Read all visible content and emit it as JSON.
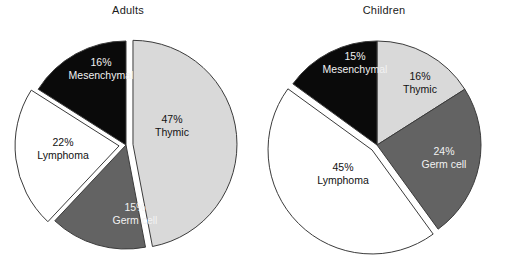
{
  "figure": {
    "background_color": "#ffffff",
    "outline_color": "#3b3b3b",
    "width": 513,
    "height": 271
  },
  "palette": {
    "thymic": "#d9d9d9",
    "germ_cell": "#636363",
    "lymphoma": "#ffffff",
    "mesenchymal": "#0a0a0a",
    "label_dark": "#111111",
    "label_light": "#f2f2f2"
  },
  "panels": {
    "adults": {
      "title": "Adults",
      "labels": {
        "thymic": {
          "pct": "47%",
          "name": "Thymic"
        },
        "germ_cell": {
          "pct": "15%",
          "name": "Germ cell"
        },
        "lymphoma": {
          "pct": "22%",
          "name": "Lymphoma"
        },
        "mesenchymal": {
          "pct": "16%",
          "name": "Mesenchymal"
        }
      }
    },
    "children": {
      "title": "Children",
      "labels": {
        "thymic": {
          "pct": "16%",
          "name": "Thymic"
        },
        "germ_cell": {
          "pct": "24%",
          "name": "Germ cell"
        },
        "lymphoma": {
          "pct": "45%",
          "name": "Lymphoma"
        },
        "mesenchymal": {
          "pct": "15%",
          "name": "Mesenchymal"
        }
      }
    }
  },
  "chart_data": [
    {
      "type": "pie",
      "title": "Adults",
      "categories": [
        "Thymic",
        "Germ cell",
        "Lymphoma",
        "Mesenchymal"
      ],
      "values": [
        47,
        15,
        22,
        16
      ],
      "unit": "%",
      "data_labels": [
        "47% Thymic",
        "15% Germ cell",
        "22% Lymphoma",
        "16% Mesenchymal"
      ],
      "colors": [
        "#d9d9d9",
        "#636363",
        "#ffffff",
        "#0a0a0a"
      ],
      "exploded": [
        "Thymic",
        "Lymphoma"
      ],
      "start_angle_deg": 0,
      "direction": "clockwise",
      "legend": "none",
      "grid": false
    },
    {
      "type": "pie",
      "title": "Children",
      "categories": [
        "Thymic",
        "Germ cell",
        "Lymphoma",
        "Mesenchymal"
      ],
      "values": [
        16,
        24,
        45,
        15
      ],
      "unit": "%",
      "data_labels": [
        "16% Thymic",
        "24% Germ cell",
        "45% Lymphoma",
        "15% Mesenchymal"
      ],
      "colors": [
        "#d9d9d9",
        "#636363",
        "#ffffff",
        "#0a0a0a"
      ],
      "exploded": [
        "Lymphoma"
      ],
      "start_angle_deg": 0,
      "direction": "clockwise",
      "legend": "none",
      "grid": false
    }
  ]
}
